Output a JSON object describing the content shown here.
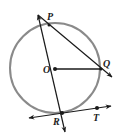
{
  "diagram": {
    "type": "circle-geometry",
    "circle": {
      "center_label": "O",
      "stroke": "#8a8a8a"
    },
    "points": {
      "P": {
        "label": "P"
      },
      "O": {
        "label": "O"
      },
      "Q": {
        "label": "Q"
      },
      "R": {
        "label": "R"
      },
      "T": {
        "label": "T"
      }
    },
    "segments": [
      {
        "name": "line-PR",
        "through": [
          "P",
          "O",
          "R"
        ],
        "arrows": "both"
      },
      {
        "name": "line-PQ",
        "through": [
          "P",
          "Q"
        ],
        "arrows": "both"
      },
      {
        "name": "segment-OQ",
        "through": [
          "O",
          "Q"
        ],
        "arrows": "none"
      },
      {
        "name": "tangent-RT",
        "through": [
          "R",
          "T"
        ],
        "arrows": "both"
      }
    ],
    "colors": {
      "line": "#1a1a1a",
      "circle": "#8a8a8a"
    }
  }
}
